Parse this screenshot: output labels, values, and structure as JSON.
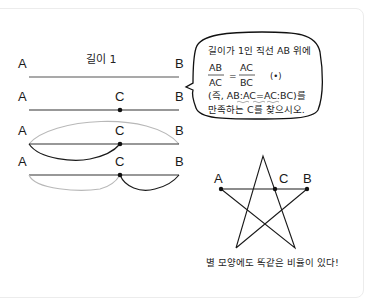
{
  "segments": {
    "length_label": "길이 1",
    "point_a": "A",
    "point_b": "B",
    "point_c": "C"
  },
  "bubble": {
    "line1": "길이가 1인 직선 AB 위에",
    "frac_left_num": "AB",
    "frac_left_den": "AC",
    "equals": "=",
    "frac_right_num": "AC",
    "frac_right_den": "BC",
    "marker": "(•)",
    "line3": "(즉, AB:AC=AC:BC)를",
    "line4": "만족하는 C를 찾으시오."
  },
  "star": {
    "point_a": "A",
    "point_b": "B",
    "point_c": "C",
    "caption": "별 모양에도 똑같은 비율이 있다!"
  },
  "colors": {
    "line": "#333333",
    "light_arc": "#b8b8b8",
    "dark_arc": "#1a1a1a",
    "border": "#ececec"
  }
}
